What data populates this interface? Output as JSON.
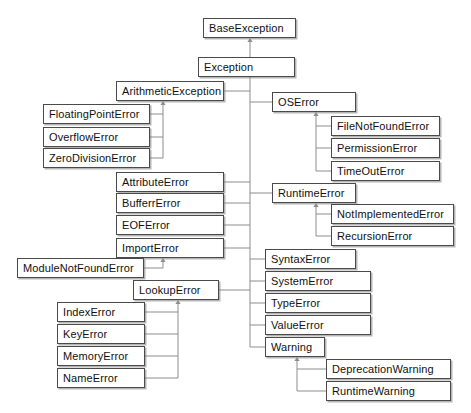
{
  "diagram": {
    "type": "class-hierarchy",
    "edge_style": "orthogonal-with-triangle-arrowhead",
    "arrow_meaning": "inherits-from (child points to parent)",
    "colors": {
      "background": "#ffffff",
      "node_border": "#4a4a4a",
      "node_fill": "#ffffff",
      "edge": "#8d8d8d",
      "text": "#111111",
      "shadow": "#787878"
    },
    "nodes": [
      {
        "id": "base_exception",
        "label": "BaseException",
        "x": 203,
        "y": 18,
        "w": 93
      },
      {
        "id": "exception",
        "label": "Exception",
        "x": 198,
        "y": 57,
        "w": 97
      },
      {
        "id": "arithmetic_exception",
        "label": "ArithmeticException",
        "x": 116,
        "y": 81,
        "w": 108
      },
      {
        "id": "floating_point_error",
        "label": "FloatingPointError",
        "x": 43,
        "y": 104,
        "w": 107
      },
      {
        "id": "overflow_error",
        "label": "OverflowError",
        "x": 43,
        "y": 127,
        "w": 107
      },
      {
        "id": "zero_division_error",
        "label": "ZeroDivisionError",
        "x": 43,
        "y": 148,
        "w": 107
      },
      {
        "id": "attribute_error",
        "label": "AttributeError",
        "x": 116,
        "y": 172,
        "w": 108
      },
      {
        "id": "bufferr_error",
        "label": "BufferrError",
        "x": 116,
        "y": 193,
        "w": 108
      },
      {
        "id": "eof_error",
        "label": "EOFError",
        "x": 116,
        "y": 215,
        "w": 108
      },
      {
        "id": "import_error",
        "label": "ImportError",
        "x": 116,
        "y": 238,
        "w": 108
      },
      {
        "id": "module_not_found",
        "label": "ModuleNotFoundError",
        "x": 17,
        "y": 258,
        "w": 127
      },
      {
        "id": "lookup_error",
        "label": "LookupError",
        "x": 133,
        "y": 280,
        "w": 86
      },
      {
        "id": "index_error",
        "label": "IndexError",
        "x": 57,
        "y": 302,
        "w": 88
      },
      {
        "id": "key_error",
        "label": "KeyError",
        "x": 57,
        "y": 324,
        "w": 88
      },
      {
        "id": "memory_error",
        "label": "MemoryError",
        "x": 57,
        "y": 346,
        "w": 88
      },
      {
        "id": "name_error",
        "label": "NameError",
        "x": 57,
        "y": 368,
        "w": 88
      },
      {
        "id": "os_error",
        "label": "OSError",
        "x": 272,
        "y": 92,
        "w": 84
      },
      {
        "id": "file_not_found_error",
        "label": "FileNotFoundError",
        "x": 331,
        "y": 116,
        "w": 109
      },
      {
        "id": "permission_error",
        "label": "PermissionError",
        "x": 331,
        "y": 138,
        "w": 109
      },
      {
        "id": "time_out_error",
        "label": "TimeOutError",
        "x": 331,
        "y": 161,
        "w": 109
      },
      {
        "id": "runtime_error",
        "label": "RuntimeError",
        "x": 272,
        "y": 183,
        "w": 84
      },
      {
        "id": "not_implemented",
        "label": "NotImplementedError",
        "x": 331,
        "y": 204,
        "w": 123
      },
      {
        "id": "recursion_error",
        "label": "RecursionError",
        "x": 331,
        "y": 226,
        "w": 123
      },
      {
        "id": "syntax_error",
        "label": "SyntaxError",
        "x": 265,
        "y": 249,
        "w": 91
      },
      {
        "id": "system_error",
        "label": "SystemError",
        "x": 265,
        "y": 271,
        "w": 106
      },
      {
        "id": "type_error",
        "label": "TypeError",
        "x": 265,
        "y": 293,
        "w": 106
      },
      {
        "id": "value_error",
        "label": "ValueError",
        "x": 265,
        "y": 315,
        "w": 106
      },
      {
        "id": "warning",
        "label": "Warning",
        "x": 265,
        "y": 337,
        "w": 60
      },
      {
        "id": "deprecation_warning",
        "label": "DeprecationWarning",
        "x": 326,
        "y": 359,
        "w": 125
      },
      {
        "id": "runtime_warning",
        "label": "RuntimeWarning",
        "x": 326,
        "y": 381,
        "w": 125
      }
    ],
    "edges": [
      {
        "child": "exception",
        "parent": "base_exception"
      },
      {
        "child": "arithmetic_exception",
        "parent": "exception"
      },
      {
        "child": "attribute_error",
        "parent": "exception"
      },
      {
        "child": "bufferr_error",
        "parent": "exception"
      },
      {
        "child": "eof_error",
        "parent": "exception"
      },
      {
        "child": "import_error",
        "parent": "exception"
      },
      {
        "child": "lookup_error",
        "parent": "exception"
      },
      {
        "child": "os_error",
        "parent": "exception"
      },
      {
        "child": "runtime_error",
        "parent": "exception"
      },
      {
        "child": "syntax_error",
        "parent": "exception"
      },
      {
        "child": "system_error",
        "parent": "exception"
      },
      {
        "child": "type_error",
        "parent": "exception"
      },
      {
        "child": "value_error",
        "parent": "exception"
      },
      {
        "child": "warning",
        "parent": "exception"
      },
      {
        "child": "floating_point_error",
        "parent": "arithmetic_exception"
      },
      {
        "child": "overflow_error",
        "parent": "arithmetic_exception"
      },
      {
        "child": "zero_division_error",
        "parent": "arithmetic_exception"
      },
      {
        "child": "module_not_found",
        "parent": "import_error"
      },
      {
        "child": "index_error",
        "parent": "lookup_error"
      },
      {
        "child": "key_error",
        "parent": "lookup_error"
      },
      {
        "child": "memory_error",
        "parent": "lookup_error"
      },
      {
        "child": "name_error",
        "parent": "lookup_error"
      },
      {
        "child": "file_not_found_error",
        "parent": "os_error"
      },
      {
        "child": "permission_error",
        "parent": "os_error"
      },
      {
        "child": "time_out_error",
        "parent": "os_error"
      },
      {
        "child": "not_implemented",
        "parent": "runtime_error"
      },
      {
        "child": "recursion_error",
        "parent": "runtime_error"
      },
      {
        "child": "deprecation_warning",
        "parent": "warning"
      },
      {
        "child": "runtime_warning",
        "parent": "warning"
      }
    ]
  }
}
